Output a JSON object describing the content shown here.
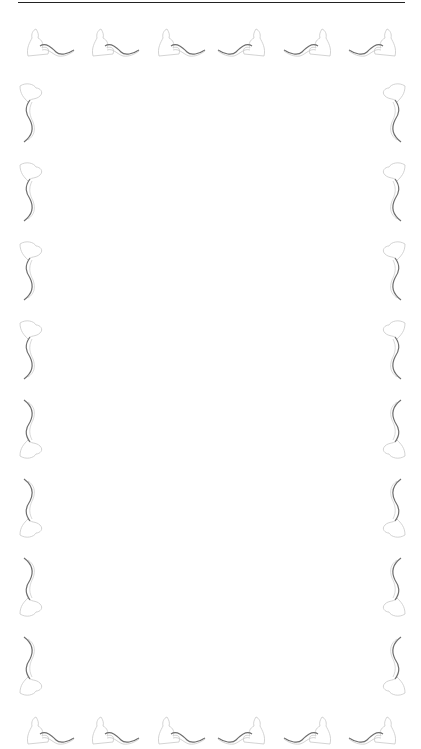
{
  "page": {
    "header": {
      "running_title": "",
      "page_number": ""
    },
    "border": {
      "motif": "swan-scroll-ornament",
      "top_count": 6,
      "bottom_count": 6,
      "left_count": 8,
      "right_count": 8,
      "stroke_color": "#6e6e6e",
      "outline_color": "#c8c8c8"
    },
    "body_text": ""
  }
}
